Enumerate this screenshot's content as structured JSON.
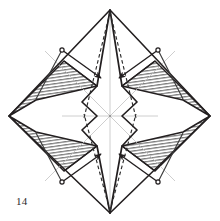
{
  "figure": {
    "caption": "14",
    "width": 220,
    "height": 221,
    "background": "#ffffff"
  },
  "style": {
    "ink": "#231f20",
    "ink_soft": "#3b3b3b",
    "guide_gray": "#b9b9b9",
    "hatch_gray": "#8a8a8a",
    "hatch_fill": "#d8d8d8",
    "paper_white": "#ffffff",
    "stroke_main": 1.6,
    "stroke_thin": 0.8,
    "stroke_guide": 0.7,
    "dash_pattern": "3.5,2.5"
  },
  "geometry": {
    "top_vertex": [
      110,
      10
    ],
    "bottom_vertex": [
      110,
      213
    ],
    "left_vertex": [
      9,
      116
    ],
    "right_vertex": [
      210,
      116
    ],
    "center": [
      110,
      116
    ],
    "outline_label": "diamond-outline",
    "left_upper_corner": [
      56,
      63
    ],
    "right_upper_corner": [
      164,
      63
    ],
    "left_lower_corner": [
      56,
      169
    ],
    "right_lower_corner": [
      164,
      169
    ]
  },
  "shapes": {
    "outline": {
      "name": "outer-diamond",
      "points": "110,10 210,116 110,213 9,116"
    },
    "hatched_regions": [
      {
        "name": "hatch-upper-left",
        "points": "9,116 64,61 97,86 36,100"
      },
      {
        "name": "hatch-lower-left",
        "points": "9,116 36,132 97,146 64,171"
      },
      {
        "name": "hatch-upper-right",
        "points": "210,116 155,61 122,86 183,100"
      },
      {
        "name": "hatch-lower-right",
        "points": "210,116 183,132 122,146 155,171"
      }
    ],
    "center_zigzag": {
      "name": "center-pleat-outline",
      "left_points": "110,10 97,86 82,102 97,116 82,130 97,146 110,213",
      "right_points": "110,10 122,86 137,102 122,116 137,130 122,146 110,213"
    },
    "guides": [
      {
        "name": "guide-horizontal",
        "x1": 62,
        "y1": 116,
        "x2": 158,
        "y2": 116
      },
      {
        "name": "guide-vertical",
        "x1": 110,
        "y1": 18,
        "x2": 110,
        "y2": 206
      },
      {
        "name": "guide-diag-nw-se",
        "x1": 48,
        "y1": 54,
        "x2": 172,
        "y2": 178
      },
      {
        "name": "guide-diag-ne-sw",
        "x1": 172,
        "y1": 54,
        "x2": 48,
        "y2": 178
      }
    ],
    "valley_dashed": [
      {
        "name": "dash-top-left",
        "x1": 110,
        "y1": 11,
        "x2": 84,
        "y2": 116
      },
      {
        "name": "dash-top-right",
        "x1": 110,
        "y1": 11,
        "x2": 136,
        "y2": 116
      },
      {
        "name": "dash-bottom-left",
        "x1": 110,
        "y1": 212,
        "x2": 84,
        "y2": 116
      },
      {
        "name": "dash-bottom-right",
        "x1": 110,
        "y1": 212,
        "x2": 136,
        "y2": 116
      }
    ],
    "fold_arrows": [
      {
        "name": "fold-arrow-upper-left",
        "dot": [
          62,
          50
        ],
        "path": "M62,50 L101,78",
        "head_at": [
          101,
          78
        ],
        "head_angle": 36,
        "direction": "down-right"
      },
      {
        "name": "fold-arrow-upper-right",
        "dot": [
          158,
          50
        ],
        "path": "M158,50 L119,78",
        "head_at": [
          119,
          78
        ],
        "head_angle": 144,
        "direction": "down-left"
      },
      {
        "name": "fold-arrow-lower-left",
        "dot": [
          62,
          182
        ],
        "path": "M62,182 L101,154",
        "head_at": [
          101,
          154
        ],
        "head_angle": -36,
        "direction": "up-right"
      },
      {
        "name": "fold-arrow-lower-right",
        "dot": [
          158,
          182
        ],
        "path": "M158,182 L119,154",
        "head_at": [
          119,
          154
        ],
        "head_angle": -144,
        "direction": "up-left"
      }
    ],
    "arrow_stems": [
      {
        "name": "arrow-stem-upper-left",
        "x1": 62,
        "y1": 50,
        "x2": 36,
        "y2": 100
      },
      {
        "name": "arrow-stem-upper-right",
        "x1": 158,
        "y1": 50,
        "x2": 183,
        "y2": 100
      },
      {
        "name": "arrow-stem-lower-left",
        "x1": 62,
        "y1": 182,
        "x2": 36,
        "y2": 132
      },
      {
        "name": "arrow-stem-lower-right",
        "x1": 158,
        "y1": 182,
        "x2": 183,
        "y2": 132
      }
    ]
  }
}
